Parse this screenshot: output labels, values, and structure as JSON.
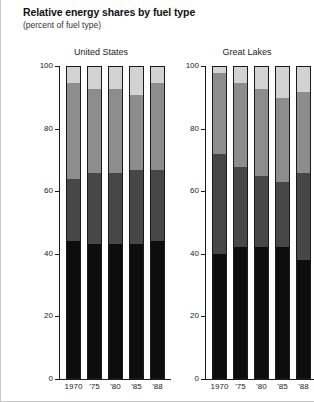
{
  "header": {
    "title": "Relative energy shares by fuel type",
    "subtitle": "(percent of fuel type)"
  },
  "chart_data": {
    "type": "bar",
    "subtype": "stacked-percent",
    "title": "Relative energy shares by fuel type",
    "subtitle": "(percent of fuel type)",
    "xlabel": "",
    "ylabel": "",
    "ylim": [
      0,
      100
    ],
    "yticks": [
      0,
      20,
      40,
      60,
      80,
      100
    ],
    "ytick_labels": [
      "0",
      "20",
      "40",
      "60",
      "80",
      "100"
    ],
    "grid": false,
    "legend": "none",
    "categories": [
      "1970",
      "'75",
      "'80",
      "'85",
      "'88"
    ],
    "series": [
      {
        "name": "segment-1-black",
        "color": "#0d0d0d"
      },
      {
        "name": "segment-2-dark-gray",
        "color": "#474747"
      },
      {
        "name": "segment-3-medium-gray",
        "color": "#8d8d8d"
      },
      {
        "name": "segment-4-light-gray",
        "color": "#d2d2d2"
      }
    ],
    "panels": [
      {
        "name": "United States",
        "label": "United States",
        "bars": [
          {
            "category": "1970",
            "values": [
              44,
              20,
              31,
              5
            ]
          },
          {
            "category": "'75",
            "values": [
              43,
              23,
              27,
              7
            ]
          },
          {
            "category": "'80",
            "values": [
              43,
              23,
              27,
              7
            ]
          },
          {
            "category": "'85",
            "values": [
              43,
              24,
              24,
              9
            ]
          },
          {
            "category": "'88",
            "values": [
              44,
              23,
              28,
              5
            ]
          }
        ]
      },
      {
        "name": "Great Lakes",
        "label": "Great Lakes",
        "bars": [
          {
            "category": "1970",
            "values": [
              40,
              32,
              26,
              2
            ]
          },
          {
            "category": "'75",
            "values": [
              42,
              26,
              27,
              5
            ]
          },
          {
            "category": "'80",
            "values": [
              42,
              23,
              28,
              7
            ]
          },
          {
            "category": "'85",
            "values": [
              42,
              21,
              27,
              10
            ]
          },
          {
            "category": "'88",
            "values": [
              38,
              28,
              26,
              8
            ]
          }
        ]
      }
    ]
  }
}
